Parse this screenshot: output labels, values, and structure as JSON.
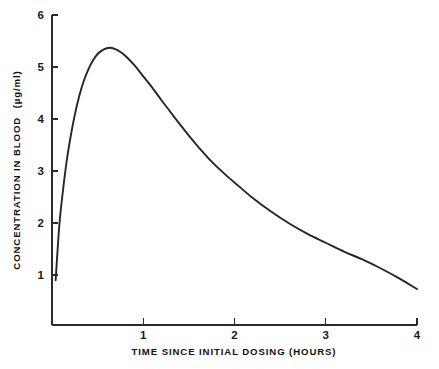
{
  "chart_data": {
    "type": "line",
    "title": "",
    "xlabel": "TIME SINCE INITIAL DOSING (HOURS)",
    "ylabel": "CONCENTRATION IN BLOOD (µg/ml)",
    "ylabel_main": "CONCENTRATION IN BLOOD",
    "ylabel_units": "(µg/ml)",
    "xlim": [
      0,
      4
    ],
    "ylim": [
      0,
      6
    ],
    "grid": false,
    "legend": "none",
    "x_ticks": [
      "1",
      "2",
      "3",
      "4"
    ],
    "x_tick_values": [
      1,
      2,
      3,
      4
    ],
    "y_ticks": [
      "1",
      "2",
      "3",
      "4",
      "5",
      "6"
    ],
    "y_tick_values": [
      1,
      2,
      3,
      4,
      5,
      6
    ],
    "series": [
      {
        "name": "Blood concentration",
        "color": "#262626",
        "x": [
          0.04,
          0.08,
          0.12,
          0.16,
          0.2,
          0.25,
          0.3,
          0.35,
          0.4,
          0.45,
          0.5,
          0.55,
          0.6,
          0.64,
          0.7,
          0.75,
          0.8,
          0.9,
          1.0,
          1.1,
          1.2,
          1.3,
          1.4,
          1.5,
          1.6,
          1.75,
          1.9,
          2.0,
          2.2,
          2.4,
          2.6,
          2.8,
          3.0,
          3.2,
          3.4,
          3.6,
          3.8,
          4.0
        ],
        "y": [
          0.9,
          1.95,
          2.62,
          3.18,
          3.62,
          4.08,
          4.45,
          4.74,
          4.96,
          5.13,
          5.25,
          5.32,
          5.36,
          5.37,
          5.34,
          5.29,
          5.22,
          5.04,
          4.82,
          4.6,
          4.36,
          4.13,
          3.9,
          3.68,
          3.47,
          3.18,
          2.93,
          2.78,
          2.48,
          2.22,
          1.99,
          1.79,
          1.62,
          1.45,
          1.3,
          1.13,
          0.94,
          0.73
        ]
      }
    ],
    "annotations": {
      "peak_time": 0.64,
      "peak_concentration": 5.37
    }
  },
  "axes": {
    "x_axis_name": "time-axis",
    "y_axis_name": "concentration-axis"
  }
}
